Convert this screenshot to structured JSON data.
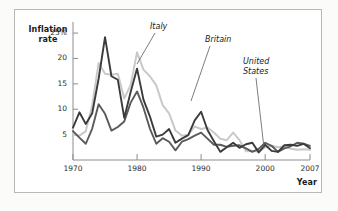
{
  "figure": {
    "background": "#fbfbfa",
    "frame_color": "#b9b9b4"
  },
  "axes": {
    "y_title": "Inflation rate",
    "x_title": "Year",
    "y_ticks": [
      "25%",
      "20",
      "15",
      "10",
      "5"
    ],
    "y_tick_values": [
      25,
      20,
      15,
      10,
      5
    ],
    "x_ticks": [
      "1970",
      "1980",
      "1990",
      "2000",
      "2007"
    ],
    "x_tick_values": [
      1970,
      1980,
      1990,
      2000,
      2007
    ]
  },
  "annotations": [
    {
      "name": "italy",
      "text": "Italy",
      "lines": [
        "Italy"
      ]
    },
    {
      "name": "britain",
      "text": "Britain",
      "lines": [
        "Britain"
      ]
    },
    {
      "name": "united-states",
      "text": "United States",
      "lines": [
        "United",
        "States"
      ]
    }
  ],
  "chart_data": {
    "type": "line",
    "title": "",
    "xlabel": "Year",
    "ylabel": "Inflation rate",
    "ylim": [
      0,
      26
    ],
    "xlim": [
      1970,
      2007
    ],
    "grid": false,
    "legend": "annotated-leader-lines",
    "y_unit": "percent",
    "x": [
      1970,
      1971,
      1972,
      1973,
      1974,
      1975,
      1976,
      1977,
      1978,
      1979,
      1980,
      1981,
      1982,
      1983,
      1984,
      1985,
      1986,
      1987,
      1988,
      1989,
      1990,
      1991,
      1992,
      1993,
      1994,
      1995,
      1996,
      1997,
      1998,
      1999,
      2000,
      2001,
      2002,
      2003,
      2004,
      2005,
      2006,
      2007
    ],
    "series": [
      {
        "name": "Britain",
        "color": "#3b3b3b",
        "values": [
          6.4,
          9.4,
          7.1,
          9.2,
          16.0,
          24.2,
          16.5,
          15.8,
          8.3,
          13.4,
          18.0,
          11.9,
          8.6,
          4.6,
          5.0,
          6.1,
          3.4,
          4.2,
          4.9,
          7.8,
          9.5,
          5.9,
          3.7,
          1.6,
          2.5,
          3.4,
          2.4,
          3.1,
          3.4,
          1.5,
          3.0,
          1.8,
          1.6,
          2.9,
          3.0,
          2.8,
          3.2,
          2.3
        ]
      },
      {
        "name": "Italy",
        "color": "#c9c9c9",
        "values": [
          5.0,
          4.8,
          5.7,
          10.8,
          19.1,
          17.0,
          16.8,
          17.0,
          12.1,
          14.8,
          21.2,
          17.8,
          16.5,
          14.7,
          10.8,
          9.2,
          5.8,
          4.8,
          5.0,
          6.6,
          6.1,
          6.4,
          5.4,
          4.2,
          3.9,
          5.4,
          3.9,
          1.7,
          1.8,
          1.6,
          2.5,
          2.8,
          2.5,
          2.7,
          2.2,
          2.0,
          2.1,
          2.0
        ]
      },
      {
        "name": "United States",
        "color": "#5a5a5a",
        "values": [
          5.7,
          4.4,
          3.2,
          6.2,
          11.0,
          9.1,
          5.8,
          6.5,
          7.6,
          11.3,
          13.5,
          10.3,
          6.2,
          3.2,
          4.3,
          3.6,
          1.9,
          3.6,
          4.1,
          4.8,
          5.4,
          4.2,
          3.0,
          3.0,
          2.6,
          2.8,
          2.9,
          2.3,
          1.6,
          2.2,
          3.4,
          2.8,
          1.6,
          2.3,
          2.7,
          3.4,
          3.2,
          2.8
        ]
      }
    ]
  }
}
